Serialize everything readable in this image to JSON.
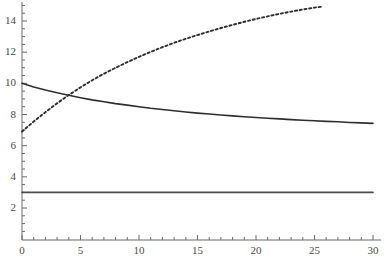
{
  "chart_data": {
    "type": "line",
    "title": "",
    "subtitle": "",
    "xlabel": "",
    "ylabel": "",
    "xlim": [
      0,
      30
    ],
    "ylim": [
      0,
      15.3
    ],
    "grid": false,
    "legend": null,
    "background_color": "#ffffff",
    "axis_color": "#6b6b6b",
    "line_color": "#333333",
    "xticks": [
      0,
      5,
      10,
      15,
      20,
      25,
      30
    ],
    "xtick_labels": [
      "0",
      "5",
      "10",
      "15",
      "20",
      "25",
      "30"
    ],
    "x_minor_tick_step": 1,
    "yticks": [
      2,
      4,
      6,
      8,
      10,
      12,
      14
    ],
    "ytick_labels": [
      "2",
      "4",
      "6",
      "8",
      "10",
      "12",
      "14"
    ],
    "y_minor_tick_step": 0.5,
    "series": [
      {
        "name": "decaying-solid-curve",
        "style": "solid",
        "color": "#2e2e2e",
        "x": [
          0,
          1,
          2,
          3,
          4,
          5,
          6,
          7,
          8,
          9,
          10,
          11,
          12,
          13,
          14,
          15,
          16,
          17,
          18,
          19,
          20,
          21,
          22,
          23,
          24,
          25,
          26,
          27,
          28,
          29,
          30
        ],
        "y": [
          10.0,
          9.77,
          9.57,
          9.39,
          9.23,
          9.08,
          8.94,
          8.82,
          8.7,
          8.6,
          8.5,
          8.4,
          8.32,
          8.24,
          8.16,
          8.09,
          8.03,
          7.97,
          7.91,
          7.86,
          7.81,
          7.76,
          7.72,
          7.67,
          7.63,
          7.6,
          7.56,
          7.53,
          7.49,
          7.46,
          7.43
        ]
      },
      {
        "name": "rising-dashed-curve",
        "style": "dashed",
        "color": "#2e2e2e",
        "x": [
          0,
          1,
          2,
          3,
          4,
          5,
          6,
          7,
          8,
          9,
          10,
          11,
          12,
          13,
          14,
          15,
          16,
          17,
          18,
          19,
          20,
          21,
          22,
          23,
          24,
          25,
          25.7
        ],
        "y": [
          6.9,
          7.55,
          8.15,
          8.72,
          9.25,
          9.74,
          10.2,
          10.62,
          11.0,
          11.36,
          11.7,
          12.02,
          12.32,
          12.6,
          12.86,
          13.1,
          13.33,
          13.55,
          13.75,
          13.95,
          14.13,
          14.3,
          14.46,
          14.6,
          14.74,
          14.86,
          14.92
        ]
      },
      {
        "name": "constant-solid-line",
        "style": "solid",
        "color": "#4a4a4a",
        "x": [
          0,
          30
        ],
        "y": [
          3.0,
          3.0
        ]
      }
    ],
    "annotations": [
      {
        "name": "curve-crossing",
        "x": 4.2,
        "y": 9.3
      }
    ]
  }
}
